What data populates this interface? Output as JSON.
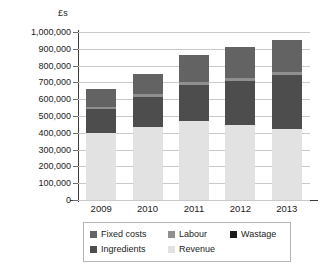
{
  "chart_data": {
    "type": "bar",
    "stacked": true,
    "title": "",
    "subtitle": "",
    "xlabel": "",
    "ylabel": "£s",
    "unit_label": "£s",
    "categories": [
      "2009",
      "2010",
      "2011",
      "2012",
      "2013"
    ],
    "ylim": [
      0,
      1000000
    ],
    "ytick_values": [
      0,
      100000,
      200000,
      300000,
      400000,
      500000,
      600000,
      700000,
      800000,
      900000,
      1000000
    ],
    "ytick_labels": [
      "0",
      "100,000",
      "200,000",
      "300,000",
      "400,000",
      "500,000",
      "600,000",
      "700,000",
      "800,000",
      "900,000",
      "1,000,000"
    ],
    "grid": true,
    "legend_position": "bottom",
    "stack_order": [
      "Revenue",
      "Ingredients",
      "Labour",
      "Fixed costs"
    ],
    "series": [
      {
        "name": "Revenue",
        "color": "#e2e2e2",
        "values": [
          400000,
          435000,
          470000,
          445000,
          425000
        ]
      },
      {
        "name": "Ingredients",
        "color": "#4d4d4d",
        "values": [
          140000,
          180000,
          215000,
          265000,
          320000
        ]
      },
      {
        "name": "Labour",
        "color": "#8f8f8f",
        "values": [
          15000,
          15000,
          15000,
          15000,
          15000
        ]
      },
      {
        "name": "Fixed costs",
        "color": "#636363",
        "values": [
          105000,
          120000,
          165000,
          185000,
          190000
        ]
      },
      {
        "name": "Wastage",
        "color": "#1a1a1a",
        "values": [
          0,
          0,
          0,
          0,
          0
        ]
      }
    ],
    "stack_totals": [
      660000,
      750000,
      865000,
      910000,
      950000
    ]
  },
  "legend": {
    "rows": [
      [
        {
          "label": "Fixed costs",
          "color": "#636363"
        },
        {
          "label": "Labour",
          "color": "#8f8f8f"
        },
        {
          "label": "Wastage",
          "color": "#1a1a1a"
        }
      ],
      [
        {
          "label": "Ingredients",
          "color": "#4d4d4d"
        },
        {
          "label": "Revenue",
          "color": "#e2e2e2"
        }
      ]
    ]
  },
  "colors": {
    "axis": "#3a3a3a",
    "gridline": "#c9c9c9",
    "text": "#1b1b1b",
    "background": "#ffffff",
    "legend_border": "#b4b4b4"
  }
}
